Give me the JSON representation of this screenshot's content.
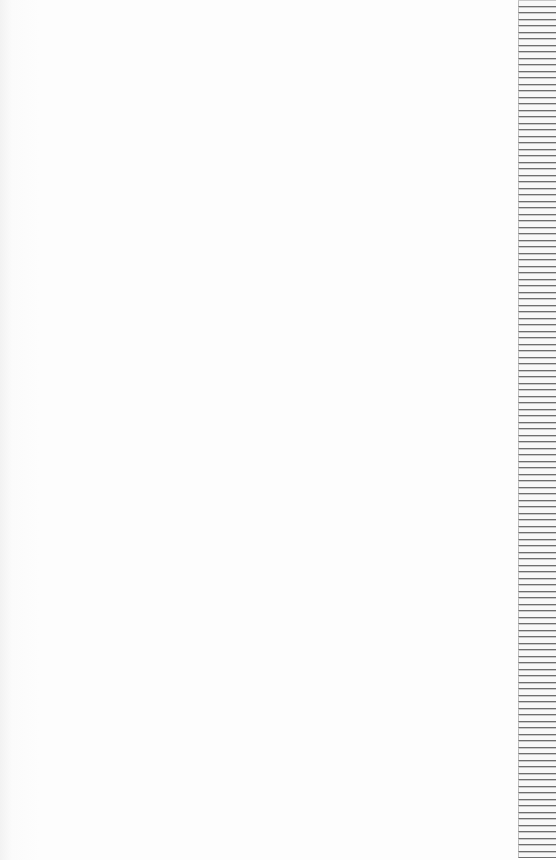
{
  "page": {
    "content": "",
    "background_color": "#fdfdfd"
  },
  "side_strip": {
    "row_count": 132,
    "line_color": "#6e6e6e"
  }
}
